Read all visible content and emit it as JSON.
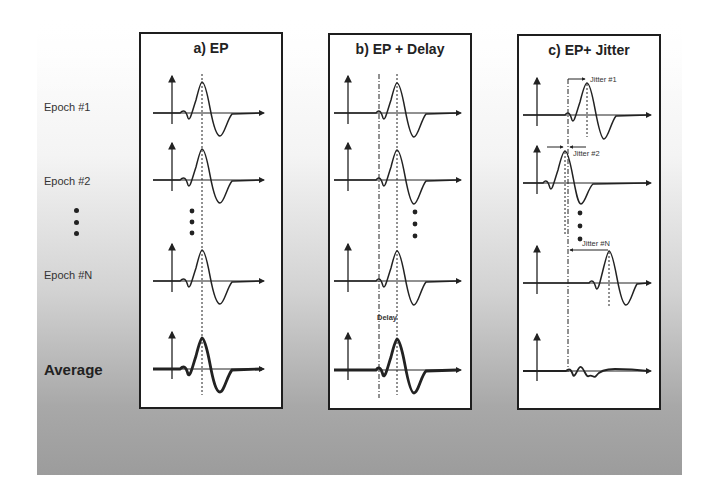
{
  "figure": {
    "row_labels": {
      "epoch1": "Epoch #1",
      "epoch2": "Epoch #2",
      "epochN": "Epoch #N",
      "average": "Average"
    },
    "panels": [
      {
        "id": "a",
        "title": "a)  EP",
        "description": "Evoked potential with fixed latency; average preserves waveform"
      },
      {
        "id": "b",
        "title": "b)  EP + Delay",
        "description": "Evoked potential with constant delay; average preserves waveform shifted by delay",
        "annotation": "Delay"
      },
      {
        "id": "c",
        "title": "c)  EP+ Jitter",
        "description": "Evoked potential with random latency jitter; average is smeared/attenuated",
        "annotations": [
          "Jitter #1",
          "Jitter #2",
          "Jitter #N"
        ]
      }
    ],
    "colors": {
      "line": "#222222",
      "panel_border": "#1e1e1e",
      "background_top": "#ffffff",
      "background_bottom": "#9c9c9c"
    }
  }
}
